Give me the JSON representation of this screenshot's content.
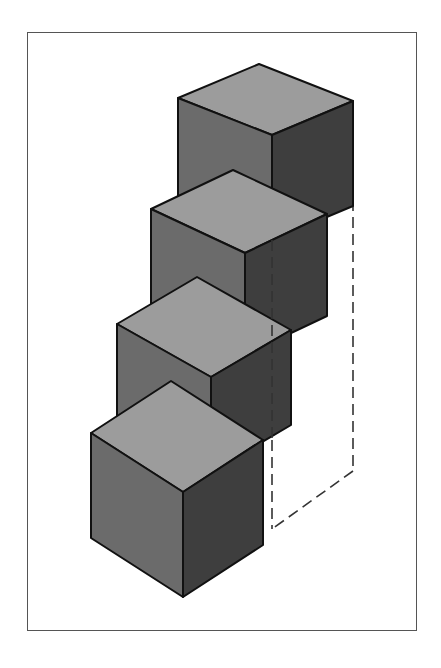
{
  "diagram": {
    "cube_count": 4,
    "colors": {
      "top_face": "#9c9c9c",
      "front_face": "#6b6b6b",
      "right_face": "#3e3e3e",
      "edge": "#111111",
      "dashed_line": "#333333",
      "frame": "#555555"
    },
    "elements": [
      {
        "name": "cube-1",
        "label": "top cube"
      },
      {
        "name": "cube-2",
        "label": "second cube"
      },
      {
        "name": "cube-3",
        "label": "third cube"
      },
      {
        "name": "cube-4",
        "label": "bottom cube"
      },
      {
        "name": "dashed-outline",
        "label": "hidden column outline"
      }
    ]
  }
}
